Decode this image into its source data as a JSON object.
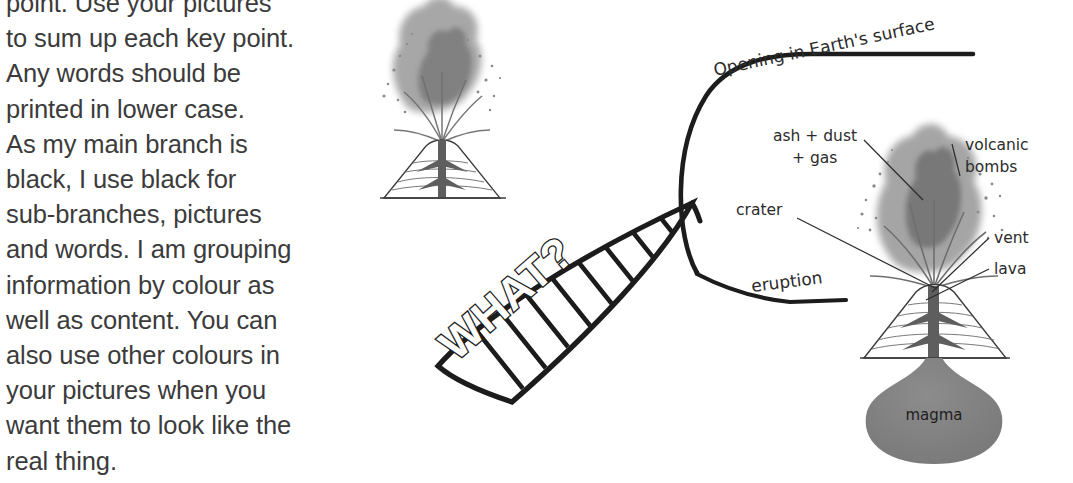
{
  "page": {
    "background_color": "#ffffff",
    "text_color": "#3b3b3b",
    "ink_color": "#1c1c1c",
    "ash_gray": "#8d8d8d",
    "magma_gray": "#808080"
  },
  "body_copy": {
    "lines": [
      "point. Use your pictures",
      "to sum up each key point.",
      "Any words should be",
      "printed in lower case.",
      "As my main branch is",
      "black, I use black for",
      "sub-branches, pictures",
      "and words. I am grouping",
      "information by colour as",
      "well as content. You can",
      "also use other colours in",
      "your pictures when you",
      "want them to look like the",
      "real thing."
    ]
  },
  "diagram": {
    "main_branch": {
      "label": "WHAT?",
      "style": "hatched-leaf-ribbon"
    },
    "sub_branches": [
      {
        "label": "Opening in Earth's surface"
      },
      {
        "label": "eruption"
      }
    ],
    "volcano_labels": [
      {
        "label": "ash + dust"
      },
      {
        "label": "+ gas"
      },
      {
        "label": "volcanic"
      },
      {
        "label": "bombs"
      },
      {
        "label": "crater"
      },
      {
        "label": "vent"
      },
      {
        "label": "lava"
      },
      {
        "label": "magma"
      }
    ],
    "illustrations": [
      {
        "name": "small-erupting-volcano"
      },
      {
        "name": "large-labelled-volcano-cross-section"
      }
    ]
  }
}
